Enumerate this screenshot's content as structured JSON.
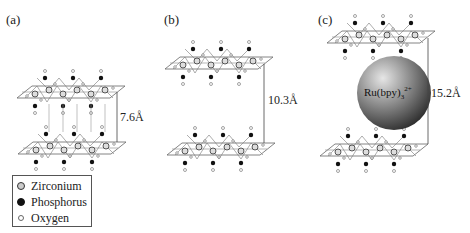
{
  "panels": [
    {
      "label": "(a)",
      "distance": "7.6Å"
    },
    {
      "label": "(b)",
      "distance": "10.3Å"
    },
    {
      "label": "(c)",
      "distance": "15.2Å",
      "intercalant": {
        "base": "Ru(bpy)",
        "sub": "3",
        "sup": "2+"
      }
    }
  ],
  "legend": {
    "items": [
      {
        "label": "Zirconium",
        "icon": "grey-circle"
      },
      {
        "label": "Phosphorus",
        "icon": "black-circle"
      },
      {
        "label": "Oxygen",
        "icon": "small-white-circle"
      }
    ]
  },
  "colors": {
    "sphere_light": "#d8d8d8",
    "sphere_dark": "#3a3a3a",
    "lines": "#555555"
  }
}
